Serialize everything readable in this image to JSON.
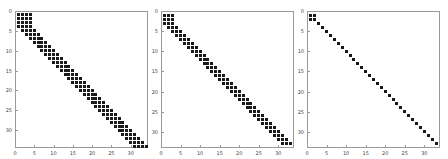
{
  "chart_data": [
    {
      "type": "scatter",
      "title": "",
      "subtitle": "sparsity pattern (spy plot)",
      "xlabel": "",
      "ylabel": "",
      "size": 34,
      "block_size": 4,
      "bandwidth": 4,
      "xlim": [
        0,
        34.5
      ],
      "ylim": [
        34.5,
        0
      ],
      "xticks": [
        0,
        5,
        10,
        15,
        20,
        25,
        30
      ],
      "yticks": [
        0,
        5,
        10,
        15,
        20,
        25,
        30
      ],
      "grid": false,
      "legend": null,
      "description": "4x4 dense block at rows/cols 1-4, then band: row i has nonzeros at cols i-3..i (i=5..34)"
    },
    {
      "type": "scatter",
      "title": "",
      "subtitle": "sparsity pattern (spy plot)",
      "xlabel": "",
      "ylabel": "",
      "size": 33,
      "block_size": 3,
      "bandwidth": 3,
      "xlim": [
        0,
        34
      ],
      "ylim": [
        34,
        0
      ],
      "xticks": [
        0,
        5,
        10,
        15,
        20,
        25,
        30
      ],
      "yticks": [
        0,
        5,
        10,
        15,
        20,
        25,
        30
      ],
      "grid": false,
      "legend": null,
      "description": "3x3 dense block at rows/cols 1-3, then band: row i has nonzeros at cols i-2..i (i=4..33)"
    },
    {
      "type": "scatter",
      "title": "",
      "subtitle": "sparsity pattern (spy plot)",
      "xlabel": "",
      "ylabel": "",
      "size": 33,
      "block_size": 2,
      "bandwidth": 1,
      "xlim": [
        0,
        34
      ],
      "ylim": [
        34,
        0
      ],
      "xticks": [
        0,
        5,
        10,
        15,
        20,
        25,
        30
      ],
      "yticks": [
        0,
        5,
        10,
        15,
        20,
        25,
        30
      ],
      "grid": false,
      "legend": null,
      "description": "2x2 dense block at rows/cols 1-2, then diagonal: row i has nonzero at col i (i=3..33)"
    }
  ],
  "panels": [
    {
      "left": 0,
      "frame": {
        "x": 15,
        "y": 11,
        "w": 133,
        "h": 137
      }
    },
    {
      "left": 0,
      "frame": {
        "x": 161,
        "y": 11,
        "w": 133,
        "h": 137
      }
    },
    {
      "left": 0,
      "frame": {
        "x": 307,
        "y": 11,
        "w": 133,
        "h": 137
      }
    }
  ],
  "colors": {
    "marker": "#1a1a1a",
    "axis": "#9a9a9a",
    "text": "#444444"
  }
}
